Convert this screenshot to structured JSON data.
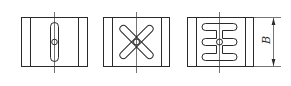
{
  "diagram": {
    "panels": [
      {
        "id": "single-vertical-slot",
        "slot_pattern": "one vertical slot with central hole"
      },
      {
        "id": "x-cross-slots",
        "slot_pattern": "two crossed diagonal slots (X) with central hole"
      },
      {
        "id": "three-horizontal-slots",
        "slot_pattern": "three horizontal slots joined by vertical slot with central hole"
      }
    ],
    "dimension": {
      "label": "B",
      "refers_to": "block height"
    },
    "colors": {
      "line": "#2a2a2a",
      "background": "#ffffff"
    }
  }
}
